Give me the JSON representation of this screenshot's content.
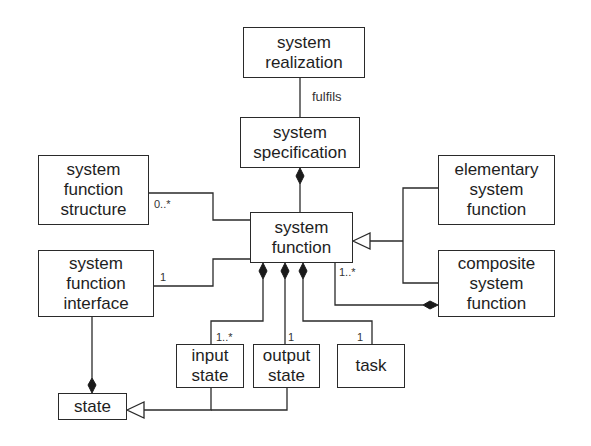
{
  "diagram": {
    "type": "uml-class-diagram",
    "classes": {
      "system_realization": {
        "lines": [
          "system",
          "realization"
        ]
      },
      "system_specification": {
        "lines": [
          "system",
          "specification"
        ]
      },
      "system_function_structure": {
        "lines": [
          "system",
          "function",
          "structure"
        ]
      },
      "system_function": {
        "lines": [
          "system",
          "function"
        ]
      },
      "system_function_interface": {
        "lines": [
          "system",
          "function",
          "interface"
        ]
      },
      "elementary_system_function": {
        "lines": [
          "elementary",
          "system",
          "function"
        ]
      },
      "composite_system_function": {
        "lines": [
          "composite",
          "system",
          "function"
        ]
      },
      "input_state": {
        "lines": [
          "input",
          "state"
        ]
      },
      "output_state": {
        "lines": [
          "output",
          "state"
        ]
      },
      "task": {
        "lines": [
          "task"
        ]
      },
      "state": {
        "lines": [
          "state"
        ]
      }
    },
    "relations": [
      {
        "from": "system realization",
        "to": "system specification",
        "kind": "association",
        "label": "fulfils"
      },
      {
        "from": "system specification",
        "to": "system function",
        "kind": "composition"
      },
      {
        "from": "system function structure",
        "to": "system function",
        "kind": "association",
        "multiplicity": "0..*"
      },
      {
        "from": "system function interface",
        "to": "system function",
        "kind": "association",
        "multiplicity": "1"
      },
      {
        "from": "elementary system function",
        "to": "system function",
        "kind": "generalization"
      },
      {
        "from": "composite system function",
        "to": "system function",
        "kind": "generalization"
      },
      {
        "from": "composite system function",
        "to": "system function",
        "kind": "composition",
        "multiplicity": "1..*"
      },
      {
        "from": "system function",
        "to": "input state",
        "kind": "composition",
        "multiplicity": "1..*"
      },
      {
        "from": "system function",
        "to": "output state",
        "kind": "composition",
        "multiplicity": "1"
      },
      {
        "from": "system function",
        "to": "task",
        "kind": "composition",
        "multiplicity": "1"
      },
      {
        "from": "system function interface",
        "to": "state",
        "kind": "composition"
      },
      {
        "from": "input state",
        "to": "state",
        "kind": "generalization"
      },
      {
        "from": "output state",
        "to": "state",
        "kind": "generalization"
      }
    ],
    "labels": {
      "fulfils": "fulfils",
      "mult_structure": "0..*",
      "mult_interface": "1",
      "mult_composite": "1..*",
      "mult_input": "1..*",
      "mult_output": "1",
      "mult_task": "1"
    }
  }
}
